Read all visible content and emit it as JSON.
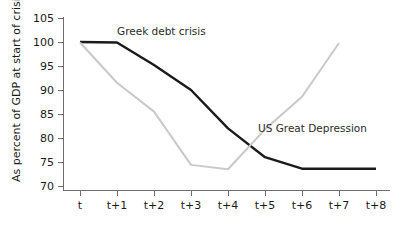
{
  "chart_data": {
    "type": "line",
    "title": "",
    "xlabel": "",
    "ylabel": "As percent of GDP at start of crisis",
    "x": [
      "t",
      "t+1",
      "t+2",
      "t+3",
      "t+4",
      "t+5",
      "t+6",
      "t+7",
      "t+8"
    ],
    "ylim": [
      70,
      105
    ],
    "yticks": [
      70,
      75,
      80,
      85,
      90,
      95,
      100,
      105
    ],
    "ytick_labels": [
      "70",
      "75",
      "80",
      "85",
      "90",
      "95",
      "100",
      "105"
    ],
    "grid": false,
    "legend_position": "inline-annotations",
    "series": [
      {
        "name": "Greek debt crisis",
        "color": "#1a1a1a",
        "width": 2.4,
        "values": [
          100.0,
          99.9,
          95.2,
          90.0,
          82.0,
          76.0,
          73.6,
          73.6,
          73.6
        ]
      },
      {
        "name": "US Great Depression",
        "color": "#c9c9c9",
        "width": 2.0,
        "values": [
          99.9,
          91.5,
          85.5,
          74.4,
          73.5,
          81.8,
          88.6,
          99.8,
          null
        ]
      }
    ],
    "annotations": [
      {
        "text": "Greek debt crisis",
        "x_px": 117,
        "y_px": 35
      },
      {
        "text": "US Great Depression",
        "x_px": 258,
        "y_px": 132
      }
    ]
  },
  "axis": {
    "y_title": "As percent of GDP at start of crisis"
  }
}
